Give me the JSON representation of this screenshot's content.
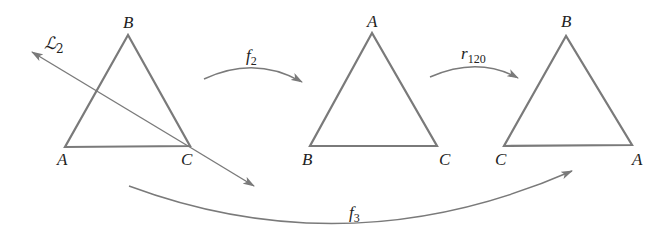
{
  "diagram": {
    "colors": {
      "stroke": "#7a7a7a",
      "text": "#222222",
      "background": "#ffffff"
    },
    "triangles": [
      {
        "name": "original",
        "vertices": {
          "top": "B",
          "bottom_left": "A",
          "bottom_right": "C"
        }
      },
      {
        "name": "after-f2",
        "vertices": {
          "top": "A",
          "bottom_left": "B",
          "bottom_right": "C"
        }
      },
      {
        "name": "after-r120",
        "vertices": {
          "top": "B",
          "bottom_left": "C",
          "bottom_right": "A"
        }
      }
    ],
    "line": {
      "label": "ℒ",
      "subscript": "2"
    },
    "arrows": [
      {
        "name": "f2",
        "label": "f",
        "subscript": "2"
      },
      {
        "name": "r120",
        "label": "r",
        "subscript": "120"
      },
      {
        "name": "f3",
        "label": "f",
        "subscript": "3"
      }
    ]
  }
}
